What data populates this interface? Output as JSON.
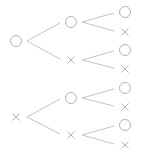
{
  "diagram": {
    "type": "tree-diagram",
    "colors": {
      "stroke": "#b4b4b4",
      "line": "#c4c4c4",
      "background": "#ffffff"
    },
    "symbols": {
      "circle": "○",
      "cross": "×"
    },
    "nodes": [
      {
        "id": "r1",
        "symbol": "circle",
        "x": 16,
        "y": 41
      },
      {
        "id": "r2",
        "symbol": "cross",
        "x": 16,
        "y": 117
      },
      {
        "id": "a1",
        "symbol": "circle",
        "x": 71,
        "y": 22
      },
      {
        "id": "a2",
        "symbol": "cross",
        "x": 71,
        "y": 60
      },
      {
        "id": "a3",
        "symbol": "circle",
        "x": 71,
        "y": 98
      },
      {
        "id": "a4",
        "symbol": "cross",
        "x": 71,
        "y": 135
      },
      {
        "id": "l1",
        "symbol": "circle",
        "x": 125,
        "y": 12
      },
      {
        "id": "l2",
        "symbol": "cross",
        "x": 125,
        "y": 32
      },
      {
        "id": "l3",
        "symbol": "circle",
        "x": 125,
        "y": 50
      },
      {
        "id": "l4",
        "symbol": "cross",
        "x": 125,
        "y": 69
      },
      {
        "id": "l5",
        "symbol": "circle",
        "x": 125,
        "y": 88
      },
      {
        "id": "l6",
        "symbol": "cross",
        "x": 125,
        "y": 107
      },
      {
        "id": "l7",
        "symbol": "circle",
        "x": 125,
        "y": 125
      },
      {
        "id": "l8",
        "symbol": "cross",
        "x": 125,
        "y": 145
      }
    ],
    "edges": [
      [
        "r1",
        "a1"
      ],
      [
        "r1",
        "a2"
      ],
      [
        "r2",
        "a3"
      ],
      [
        "r2",
        "a4"
      ],
      [
        "a1",
        "l1"
      ],
      [
        "a1",
        "l2"
      ],
      [
        "a2",
        "l3"
      ],
      [
        "a2",
        "l4"
      ],
      [
        "a3",
        "l5"
      ],
      [
        "a3",
        "l6"
      ],
      [
        "a4",
        "l7"
      ],
      [
        "a4",
        "l8"
      ]
    ]
  }
}
